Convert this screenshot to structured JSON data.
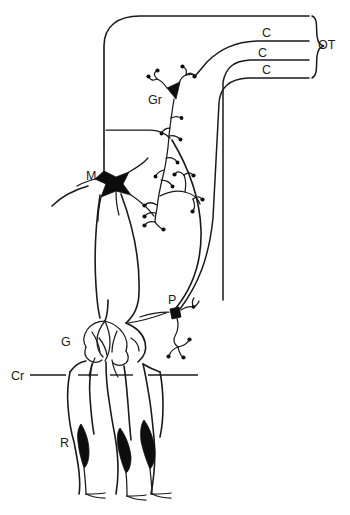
{
  "figure": {
    "background_color": "#ffffff",
    "ink_color": "#1a1a1a",
    "soma_color": "#0d0d0d",
    "width": 350,
    "height": 515
  },
  "labels": {
    "optic_tectum": "OT",
    "climbing_fiber_1": "C",
    "climbing_fiber_2": "C",
    "climbing_fiber_3": "C",
    "granule_cell": "Gr",
    "mauthner_cell": "M",
    "purkinje_cell": "P",
    "ganglion": "G",
    "crista": "Cr",
    "receptor": "R"
  },
  "elements": [
    {
      "name": "optic-tectum-bracket",
      "label": "OT",
      "kind": "brace-group",
      "count": 3
    },
    {
      "name": "c-fiber-tract",
      "label": "C",
      "kind": "fiber",
      "count": 3
    },
    {
      "name": "granule-cell",
      "label": "Gr",
      "kind": "neuron-soma",
      "shape": "triangular-dark"
    },
    {
      "name": "mauthner-cell",
      "label": "M",
      "kind": "neuron-soma",
      "shape": "stellate-dark"
    },
    {
      "name": "purkinje-cell",
      "label": "P",
      "kind": "neuron-soma",
      "shape": "small-dark-block"
    },
    {
      "name": "ganglion-cluster",
      "label": "G",
      "kind": "cell-cluster",
      "shape": "lobed-rosette"
    },
    {
      "name": "crista-line",
      "label": "Cr",
      "kind": "reference-line",
      "style": "dashed"
    },
    {
      "name": "receptor-cell",
      "label": "R",
      "kind": "receptor",
      "shape": "spindle-dark",
      "count": 3
    }
  ]
}
